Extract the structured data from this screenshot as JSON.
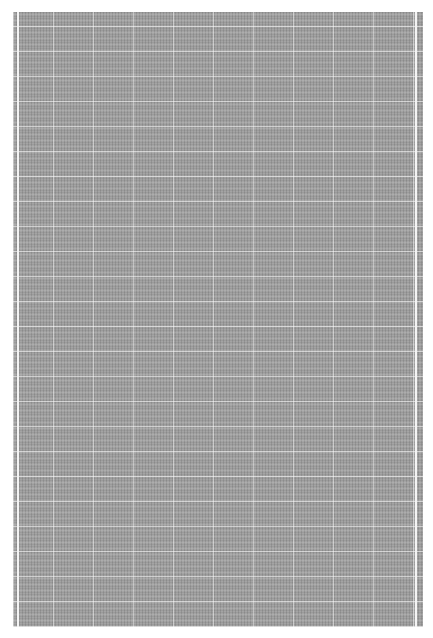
{
  "image": {
    "subject": "gray woven texture swatch",
    "colors": {
      "background": "#ffffff",
      "swatch": "#a4a4a4",
      "grid_lines": "#f0f0f0"
    }
  }
}
